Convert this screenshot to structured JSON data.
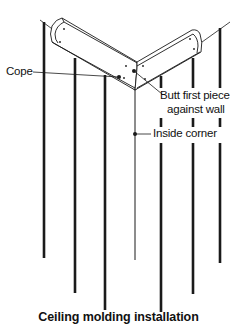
{
  "diagram": {
    "title": "Ceiling molding installation",
    "labels": {
      "cope": "Cope",
      "butt_line1": "Butt first piece",
      "butt_line2": "against wall",
      "inside_corner": "Inside corner"
    },
    "colors": {
      "ink": "#1a1a1a",
      "background": "#ffffff"
    }
  }
}
